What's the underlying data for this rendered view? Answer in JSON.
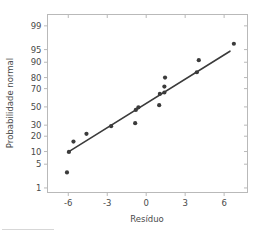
{
  "figure": {
    "background_color": "#ffffff",
    "frame_color": "#b9b9b9",
    "ink_color": "#3b3b3b",
    "tick_label_color": "#4a4a4a"
  },
  "chart_data": {
    "type": "scatter",
    "title": "",
    "subtitle": "",
    "xlabel": "Resíduo",
    "ylabel": "Probabilidade normal",
    "xlim": [
      -7.6,
      7.8
    ],
    "ylim_percent": [
      0.7,
      99.6
    ],
    "yscale": "normal-probability",
    "grid": false,
    "legend": null,
    "xticks": [
      -6,
      -3,
      0,
      3,
      6
    ],
    "xticklabels": [
      "-6",
      "-3",
      "0",
      "3",
      "6"
    ],
    "yticks": [
      1,
      5,
      10,
      20,
      30,
      50,
      70,
      80,
      90,
      95,
      99
    ],
    "yticklabels": [
      "1",
      "5",
      "10",
      "20",
      "30",
      "50",
      "70",
      "80",
      "90",
      "95",
      "99"
    ],
    "series": [
      {
        "name": "residuos",
        "type": "scatter",
        "marker": "circle",
        "color": "#3b3b3b",
        "points": [
          {
            "x": -6.1,
            "y": 3.0
          },
          {
            "x": -5.95,
            "y": 9.8
          },
          {
            "x": -5.6,
            "y": 16.0
          },
          {
            "x": -4.6,
            "y": 22.0
          },
          {
            "x": -2.7,
            "y": 29.0
          },
          {
            "x": -0.85,
            "y": 32.0
          },
          {
            "x": -0.8,
            "y": 46.5
          },
          {
            "x": -0.6,
            "y": 49.5
          },
          {
            "x": 1.0,
            "y": 52.0
          },
          {
            "x": 1.05,
            "y": 64.5
          },
          {
            "x": 1.4,
            "y": 66.0
          },
          {
            "x": 1.4,
            "y": 72.0
          },
          {
            "x": 1.45,
            "y": 80.0
          },
          {
            "x": 3.9,
            "y": 84.0
          },
          {
            "x": 4.05,
            "y": 91.0
          },
          {
            "x": 6.75,
            "y": 96.5
          }
        ]
      },
      {
        "name": "linha-de-referencia",
        "type": "line",
        "color": "#3b3b3b",
        "endpoints": [
          {
            "x": -6.05,
            "y": 9.6
          },
          {
            "x": 6.45,
            "y": 94.5
          }
        ]
      }
    ]
  }
}
